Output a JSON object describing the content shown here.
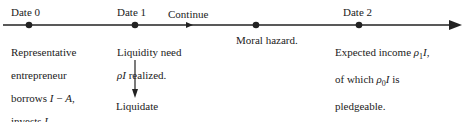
{
  "timeline": {
    "events": [
      {
        "id": "date0",
        "label": "Date 0",
        "x": 29,
        "description": [
          "Representative",
          "entrepreneur",
          "borrows I − A,",
          "invests I."
        ]
      },
      {
        "id": "date1",
        "label": "Date 1",
        "x": 135,
        "description": [
          "Liquidity need",
          "ρI realized."
        ]
      },
      {
        "id": "moral-hazard",
        "label": "",
        "x": 256,
        "description": [
          "Moral hazard."
        ]
      },
      {
        "id": "date2",
        "label": "Date 2",
        "x": 359,
        "description": [
          "Expected income ρ1I,",
          "of which ρ0I is",
          "pledgeable."
        ]
      }
    ],
    "branches": {
      "continue_label": "Continue",
      "liquidate_label": "Liquidate"
    }
  },
  "text": {
    "date0": "Date 0",
    "date1": "Date 1",
    "date2": "Date 2",
    "continue": "Continue",
    "liquidate": "Liquidate",
    "moral_hazard": "Moral hazard.",
    "d0_l1": "Representative",
    "d0_l2": "entrepreneur",
    "d0_l3_a": "borrows ",
    "d0_l3_b": "I",
    "d0_l3_c": " − ",
    "d0_l3_d": "A",
    "d0_l3_e": ",",
    "d0_l4_a": "invests ",
    "d0_l4_b": "I",
    "d0_l4_c": ".",
    "d1_l1": "Liquidity need",
    "d1_l2_a": "ρI",
    "d1_l2_b": " realized.",
    "d2_l1_a": "Expected income ",
    "d2_l1_b": "ρ",
    "d2_l1_sub": "1",
    "d2_l1_c": "I",
    "d2_l1_d": ",",
    "d2_l2_a": "of which ",
    "d2_l2_b": "ρ",
    "d2_l2_sub": "0",
    "d2_l2_c": "I",
    "d2_l2_d": " is",
    "d2_l3": "pledgeable."
  },
  "colors": {
    "line": "#222222",
    "text": "#222222",
    "background": "#ffffff"
  }
}
